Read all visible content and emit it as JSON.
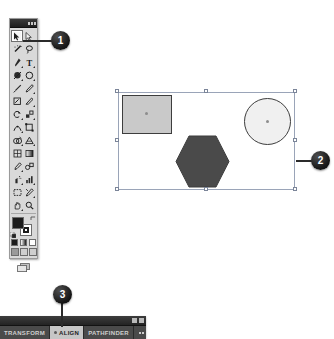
{
  "app": {
    "name": "Adobe Illustrator",
    "document_note": "Vector shapes selected on artboard"
  },
  "tools_panel": {
    "title": "Tools",
    "titlebar_icons": [
      "collapse-icon",
      "close-icon"
    ],
    "selected_tool": "selection-tool",
    "tools": [
      {
        "name": "selection-tool",
        "label": "Selection",
        "glyph": "arrow",
        "has_flyout": false,
        "selected": true
      },
      {
        "name": "direct-selection-tool",
        "label": "Direct Selection",
        "glyph": "arrow-white",
        "has_flyout": true,
        "selected": false
      },
      {
        "name": "magic-wand-tool",
        "label": "Magic Wand",
        "glyph": "wand",
        "has_flyout": false,
        "selected": false
      },
      {
        "name": "lasso-tool",
        "label": "Lasso",
        "glyph": "lasso",
        "has_flyout": false,
        "selected": false
      },
      {
        "name": "pen-tool",
        "label": "Pen",
        "glyph": "pen",
        "has_flyout": true,
        "selected": false
      },
      {
        "name": "type-tool",
        "label": "Type",
        "glyph": "type",
        "has_flyout": true,
        "selected": false
      },
      {
        "name": "line-segment-tool",
        "label": "Line Segment",
        "glyph": "line",
        "has_flyout": true,
        "selected": false
      },
      {
        "name": "ellipse-tool",
        "label": "Ellipse",
        "glyph": "ellipse",
        "has_flyout": true,
        "selected": false
      },
      {
        "name": "paintbrush-tool",
        "label": "Paintbrush",
        "glyph": "brush",
        "has_flyout": false,
        "selected": false
      },
      {
        "name": "pencil-tool",
        "label": "Pencil",
        "glyph": "pencil",
        "has_flyout": true,
        "selected": false
      },
      {
        "name": "blob-brush-tool",
        "label": "Blob Brush",
        "glyph": "blob",
        "has_flyout": false,
        "selected": false
      },
      {
        "name": "eraser-tool",
        "label": "Eraser",
        "glyph": "eraser",
        "has_flyout": true,
        "selected": false
      },
      {
        "name": "rotate-tool",
        "label": "Rotate",
        "glyph": "rotate",
        "has_flyout": true,
        "selected": false
      },
      {
        "name": "scale-tool",
        "label": "Scale",
        "glyph": "scale",
        "has_flyout": true,
        "selected": false
      },
      {
        "name": "width-tool",
        "label": "Width",
        "glyph": "width",
        "has_flyout": true,
        "selected": false
      },
      {
        "name": "free-transform-tool",
        "label": "Free Transform",
        "glyph": "transform",
        "has_flyout": false,
        "selected": false
      },
      {
        "name": "shape-builder-tool",
        "label": "Shape Builder",
        "glyph": "shapebuild",
        "has_flyout": true,
        "selected": false
      },
      {
        "name": "perspective-grid-tool",
        "label": "Perspective Grid",
        "glyph": "perspective",
        "has_flyout": true,
        "selected": false
      },
      {
        "name": "mesh-tool",
        "label": "Mesh",
        "glyph": "mesh",
        "has_flyout": false,
        "selected": false
      },
      {
        "name": "gradient-tool",
        "label": "Gradient",
        "glyph": "gradient",
        "has_flyout": false,
        "selected": false
      },
      {
        "name": "eyedropper-tool",
        "label": "Eyedropper",
        "glyph": "eyedropper",
        "has_flyout": true,
        "selected": false
      },
      {
        "name": "blend-tool",
        "label": "Blend",
        "glyph": "blend",
        "has_flyout": false,
        "selected": false
      },
      {
        "name": "symbol-sprayer-tool",
        "label": "Symbol Sprayer",
        "glyph": "sprayer",
        "has_flyout": true,
        "selected": false
      },
      {
        "name": "column-graph-tool",
        "label": "Column Graph",
        "glyph": "graph",
        "has_flyout": true,
        "selected": false
      },
      {
        "name": "artboard-tool",
        "label": "Artboard",
        "glyph": "artboard",
        "has_flyout": false,
        "selected": false
      },
      {
        "name": "slice-tool",
        "label": "Slice",
        "glyph": "slice",
        "has_flyout": true,
        "selected": false
      },
      {
        "name": "hand-tool",
        "label": "Hand",
        "glyph": "hand",
        "has_flyout": true,
        "selected": false
      },
      {
        "name": "zoom-tool",
        "label": "Zoom",
        "glyph": "zoom",
        "has_flyout": false,
        "selected": false
      }
    ],
    "fill_stroke": {
      "fill_label": "Fill",
      "stroke_label": "Stroke",
      "fill_color": "#1c1c1c",
      "stroke_color": "#1c1c1c",
      "swap_label": "Swap Fill and Stroke",
      "default_label": "Default Fill and Stroke"
    },
    "paint_modes": [
      {
        "name": "color-mode-button",
        "label": "Color"
      },
      {
        "name": "gradient-mode-button",
        "label": "Gradient"
      },
      {
        "name": "none-mode-button",
        "label": "None"
      }
    ],
    "screen_modes": [
      {
        "name": "normal-screen-mode-button",
        "label": "Normal Screen Mode",
        "active": true
      },
      {
        "name": "fullscreen-menubar-mode-button",
        "label": "Full Screen With Menu Bar",
        "active": false
      },
      {
        "name": "fullscreen-mode-button",
        "label": "Full Screen Mode",
        "active": false
      }
    ],
    "footer_button": {
      "name": "change-screen-mode-button",
      "label": "Change Screen Mode"
    }
  },
  "artboard": {
    "label": "Artboard",
    "selection": {
      "label": "Selection bounding box",
      "handle_count": 8
    },
    "shapes": [
      {
        "name": "rectangle-shape",
        "label": "Rectangle",
        "fill": "#c9c9c9",
        "stroke": "#3d3d3d"
      },
      {
        "name": "hexagon-shape",
        "label": "Hexagon",
        "fill": "#4a4a4a",
        "stroke": "#3d3d3d"
      },
      {
        "name": "circle-shape",
        "label": "Circle",
        "fill": "#f0f0f0",
        "stroke": "#3d3d3d"
      }
    ]
  },
  "callouts": [
    {
      "name": "callout-1",
      "number": "1",
      "points_to": "selection-tool"
    },
    {
      "name": "callout-2",
      "number": "2",
      "points_to": "selection-bounding-box"
    },
    {
      "name": "callout-3",
      "number": "3",
      "points_to": "align-panel-tab"
    }
  ],
  "bottom_panel": {
    "titlebar_icons": [
      "collapse-icon",
      "close-icon"
    ],
    "tabs": [
      {
        "name": "tab-transform",
        "label": "TRANSFORM",
        "active": false
      },
      {
        "name": "tab-align",
        "label": "ALIGN",
        "active": true
      },
      {
        "name": "tab-pathfinder",
        "label": "PATHFINDER",
        "active": false
      }
    ],
    "menu_button": {
      "name": "panel-menu-button",
      "label": "Panel Menu"
    }
  }
}
